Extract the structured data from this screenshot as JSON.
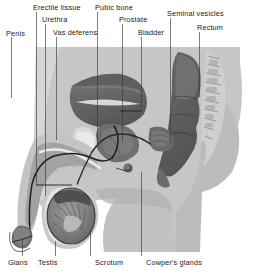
{
  "figure": {
    "width": 256,
    "height": 279,
    "background_color": "#ffffff"
  },
  "palette": {
    "page_background": "#ffffff",
    "body_tissue_light": "#c9c9c9",
    "body_tissue_mid": "#b4b4b4",
    "body_tissue_pale": "#dcdcdc",
    "organ_dark": "#6e6e6e",
    "organ_darker": "#585858",
    "organ_mid": "#8a8a8a",
    "organ_light": "#a5a5a5",
    "outline": "#222222",
    "leader_line": "#3a3a3a",
    "label_text": "#1b1b1b",
    "highlight_white": "#f2f2f2"
  },
  "labels": [
    {
      "id": "penis",
      "text": "Penis",
      "x": 6,
      "y": 30,
      "anchor": "start"
    },
    {
      "id": "erectile-tissue",
      "text": "Erectile tissue",
      "x": 33,
      "y": 4,
      "anchor": "start"
    },
    {
      "id": "urethra",
      "text": "Urethra",
      "x": 42,
      "y": 16,
      "anchor": "start"
    },
    {
      "id": "vas-deferens",
      "text": "Vas deferens",
      "x": 53,
      "y": 29,
      "anchor": "start"
    },
    {
      "id": "pubic-bone",
      "text": "Pubic bone",
      "x": 95,
      "y": 4,
      "anchor": "start"
    },
    {
      "id": "prostate",
      "text": "Prostate",
      "x": 119,
      "y": 16,
      "anchor": "start"
    },
    {
      "id": "bladder",
      "text": "Bladder",
      "x": 138,
      "y": 29,
      "anchor": "start"
    },
    {
      "id": "seminal-vesicles",
      "text": "Seminal vesicles",
      "x": 167,
      "y": 10,
      "anchor": "start"
    },
    {
      "id": "rectum",
      "text": "Rectum",
      "x": 197,
      "y": 24,
      "anchor": "start"
    },
    {
      "id": "glans",
      "text": "Glans",
      "x": 8,
      "y": 259,
      "anchor": "start"
    },
    {
      "id": "testis",
      "text": "Testis",
      "x": 38,
      "y": 259,
      "anchor": "start"
    },
    {
      "id": "scrotum",
      "text": "Scrotum",
      "x": 95,
      "y": 259,
      "anchor": "start"
    },
    {
      "id": "cowpers-glands",
      "text": "Cowper's glands",
      "x": 146,
      "y": 259,
      "anchor": "start"
    }
  ],
  "leader_lines": [
    {
      "id": "leader-penis",
      "points": "11,37 11,98"
    },
    {
      "id": "leader-erectile-tissue",
      "points": "36,12 36,185"
    },
    {
      "id": "leader-urethra",
      "points": "45,24 45,196"
    },
    {
      "id": "leader-vas-deferens",
      "points": "56,37 56,140"
    },
    {
      "id": "leader-pubic-bone",
      "points": "97,12 97,148"
    },
    {
      "id": "leader-prostate",
      "points": "122,24 122,142"
    },
    {
      "id": "leader-bladder",
      "points": "141,37 141,111"
    },
    {
      "id": "leader-seminal-vesicles",
      "points": "170,18 170,143"
    },
    {
      "id": "leader-rectum",
      "points": "199,32 199,97"
    },
    {
      "id": "leader-glans",
      "points": "22,256 22,239"
    },
    {
      "id": "leader-testis",
      "points": "55,256 55,241"
    },
    {
      "id": "leader-scrotum",
      "points": "90,256 90,232"
    },
    {
      "id": "leader-cowpers-glands",
      "points": "141,256 141,172"
    }
  ],
  "inner_pointers": [
    {
      "id": "pointer-erectile-tissue",
      "points": "36,185 72,185"
    },
    {
      "id": "pointer-bladder",
      "points": "141,111 120,111"
    }
  ],
  "structures": [
    {
      "id": "body-silhouette",
      "name": "torso-pelvis-outline"
    },
    {
      "id": "bladder-organ",
      "name": "bladder"
    },
    {
      "id": "prostate-organ",
      "name": "prostate-gland"
    },
    {
      "id": "seminal-vesicle",
      "name": "seminal-vesicle"
    },
    {
      "id": "rectum-organ",
      "name": "rectum"
    },
    {
      "id": "sacrum-spine",
      "name": "sacrum-vertebrae"
    },
    {
      "id": "pubic-bone-organ",
      "name": "pubic-bone"
    },
    {
      "id": "penis-shaft",
      "name": "penis-shaft"
    },
    {
      "id": "glans-organ",
      "name": "glans-penis"
    },
    {
      "id": "testis-organ",
      "name": "testis"
    },
    {
      "id": "scrotum-sac",
      "name": "scrotum"
    },
    {
      "id": "urethra-tube",
      "name": "urethra-channel"
    },
    {
      "id": "vas-deferens-duct",
      "name": "vas-deferens-duct"
    }
  ]
}
